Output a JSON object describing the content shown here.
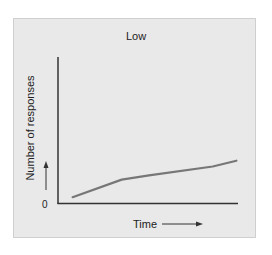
{
  "chart_data": {
    "type": "line",
    "title": "Low",
    "xlabel": "Time",
    "ylabel": "Number of responses",
    "y_origin_label": "0",
    "grid": false,
    "legend": null,
    "series": [
      {
        "name": "Low",
        "color": "#777777",
        "points": [
          {
            "x": 0.08,
            "y": 0.04
          },
          {
            "x": 0.35,
            "y": 0.16
          },
          {
            "x": 0.5,
            "y": 0.19
          },
          {
            "x": 0.85,
            "y": 0.25
          },
          {
            "x": 0.98,
            "y": 0.29
          }
        ]
      }
    ],
    "xlim": [
      0,
      1
    ],
    "ylim": [
      0,
      1
    ]
  },
  "labels": {
    "title": "Low",
    "ylabel": "Number of responses",
    "zero": "0",
    "xlabel": "Time"
  },
  "colors": {
    "panel_bg": "#e9e9e9",
    "axis": "#333333",
    "curve": "#777777"
  }
}
